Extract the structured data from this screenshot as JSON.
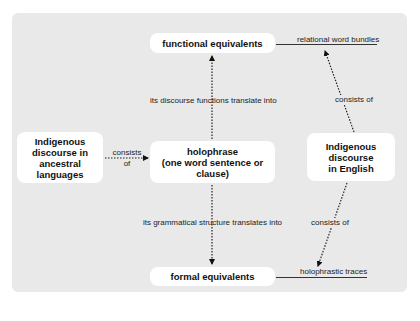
{
  "diagram": {
    "nodes": {
      "functional": "functional equivalents",
      "formal": "formal equivalents",
      "holophrase_line1": "holophrase",
      "holophrase_line2": "(one word sentence or clause)",
      "indigenous_ancestral_line1": "Indigenous",
      "indigenous_ancestral_line2": "discourse in",
      "indigenous_ancestral_line3": "ancestral languages",
      "indigenous_english_line1": "Indigenous",
      "indigenous_english_line2": "discourse",
      "indigenous_english_line3": "in English"
    },
    "annotations": {
      "relational": "relational word bundles",
      "holophrastic": "holophrastic traces"
    },
    "edge_labels": {
      "discourse_functions": "its discourse functions translate into",
      "grammatical_structure": "its grammatical structure translates into",
      "consists_top": "consists of",
      "consists_bottom": "consists of",
      "consists_left_line1": "consists",
      "consists_left_line2": "of"
    },
    "colors": {
      "panel": "#e9e9e9",
      "box": "#ffffff",
      "text": "#111111"
    }
  }
}
